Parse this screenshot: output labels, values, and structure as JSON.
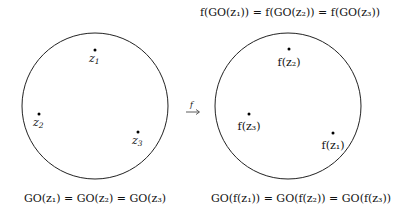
{
  "diagram": {
    "left": {
      "circle": {
        "cx": 95,
        "cy": 106,
        "r": 73
      },
      "points": [
        {
          "id": "z1",
          "label": "z",
          "sub": "1",
          "x": 95,
          "y": 50
        },
        {
          "id": "z2",
          "label": "z",
          "sub": "2",
          "x": 39,
          "y": 114
        },
        {
          "id": "z3",
          "label": "z",
          "sub": "3",
          "x": 138,
          "y": 132
        }
      ],
      "caption": "GO(z₁) = GO(z₂) = GO(z₃)"
    },
    "arrow": {
      "label": "f",
      "symbol": "→"
    },
    "right": {
      "title": "f(GO(z₁)) = f(GO(z₂)) = f(GO(z₃))",
      "circle": {
        "cx": 288,
        "cy": 106,
        "r": 73
      },
      "points": [
        {
          "id": "fz2",
          "label": "f(z₂)",
          "x": 289,
          "y": 49
        },
        {
          "id": "fz3",
          "label": "f(z₃)",
          "x": 249,
          "y": 114
        },
        {
          "id": "fz1",
          "label": "f(z₁)",
          "x": 333,
          "y": 133
        }
      ],
      "caption": "GO(f(z₁)) = GO(f(z₂)) = GO(f(z₃))"
    }
  }
}
